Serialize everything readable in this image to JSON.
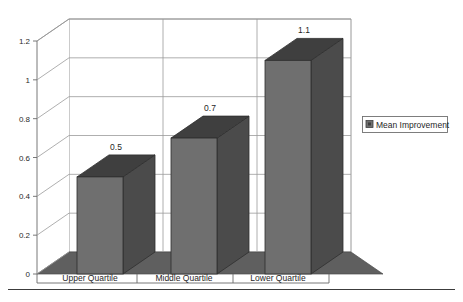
{
  "chart_data": {
    "type": "bar",
    "title": "",
    "subtitle": "",
    "xlabel": "",
    "ylabel": "",
    "categories": [
      "Upper Quartile",
      "Middle Quartile",
      "Lower Quartile"
    ],
    "values": [
      0.5,
      0.7,
      1.1
    ],
    "data_labels": [
      "0.5",
      "0.7",
      "1.1"
    ],
    "series": [
      {
        "name": "Mean Improvement",
        "values": [
          0.5,
          0.7,
          1.1
        ]
      }
    ],
    "ylim": [
      0,
      1.2
    ],
    "ytick_values": [
      0,
      0.2,
      0.4,
      0.6,
      0.8,
      1,
      1.2
    ],
    "ytick_labels": [
      "0",
      "0.2",
      "0.4",
      "0.6",
      "0.8",
      "1",
      "1.2"
    ],
    "grid": true,
    "grid_axis": "y",
    "legend": {
      "position": "right",
      "entries": [
        "Mean Improvement"
      ]
    },
    "style": "3d-column",
    "colors": {
      "bar_front": "#6f6f6f",
      "bar_side": "#4b4b4b",
      "bar_top": "#3f3f3f",
      "floor": "#5f5f5f",
      "wall": "#ffffff",
      "gridline": "#9a9a9a",
      "text": "#1f1f1f"
    }
  },
  "legend": {
    "marker_icon": "legend-swatch-icon",
    "label": "Mean Improvement"
  },
  "axis": {
    "y_ticks": [
      "1.2",
      "1",
      "0.8",
      "0.6",
      "0.4",
      "0.2",
      "0"
    ],
    "x_categories": [
      "Upper Quartile",
      "Middle Quartile",
      "Lower Quartile"
    ]
  },
  "bars": [
    {
      "label": "Upper Quartile",
      "value_text": "0.5"
    },
    {
      "label": "Middle Quartile",
      "value_text": "0.7"
    },
    {
      "label": "Lower Quartile",
      "value_text": "1.1"
    }
  ],
  "footer": {
    "rule": "horizontal-rule"
  }
}
